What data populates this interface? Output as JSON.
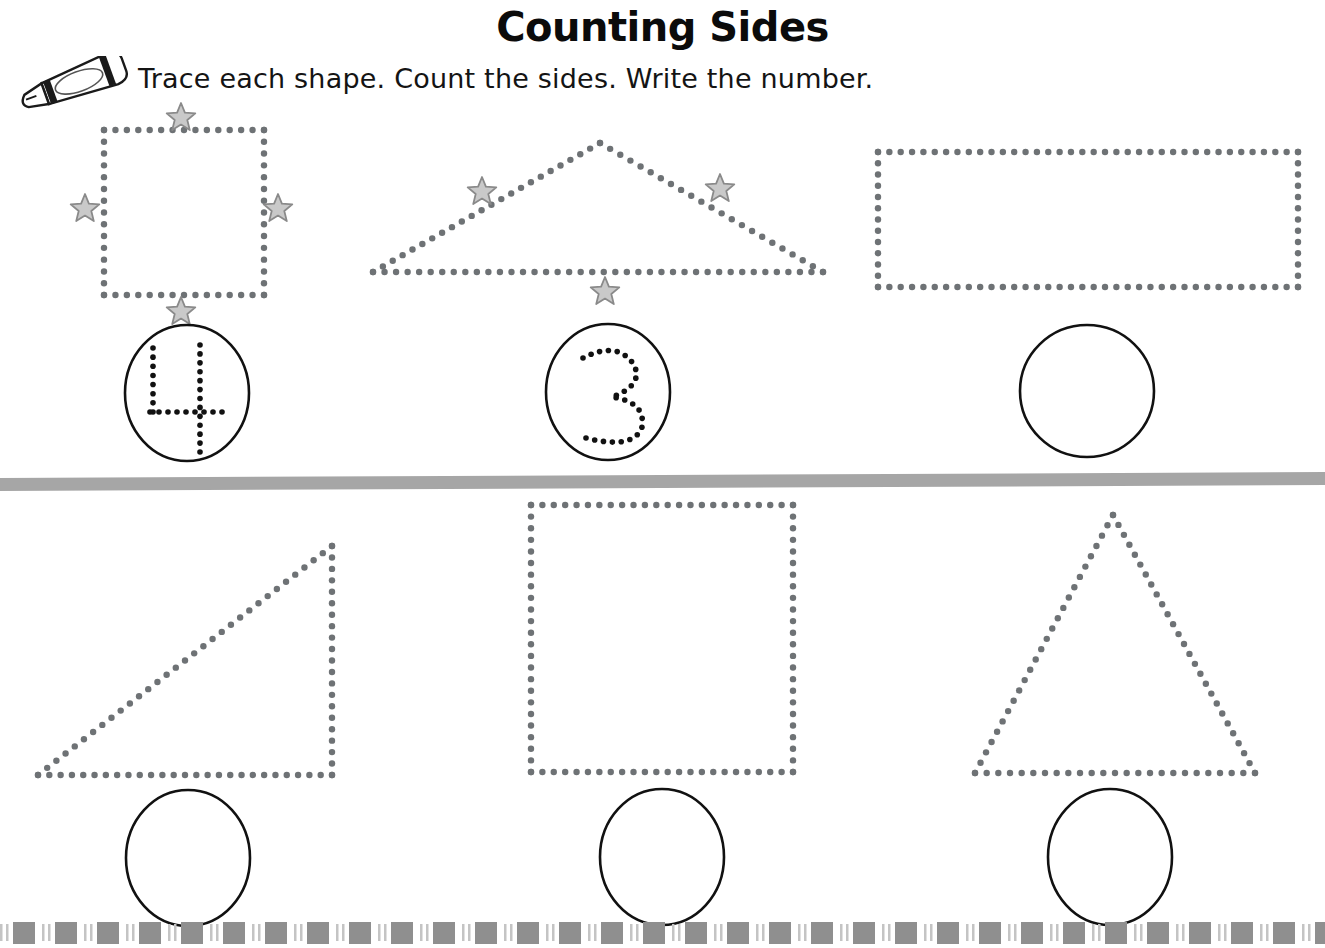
{
  "page": {
    "title": "Counting Sides",
    "instructions": "Trace each shape.  Count the sides.  Write the number.",
    "crayon_icon": "crayon-icon",
    "width": 1325,
    "height": 948
  },
  "colors": {
    "ink": "#141414",
    "title": "#0b0b0b",
    "dot": "#6e7275",
    "star_fill": "#c9c9c9",
    "star_stroke": "#8a8a8a",
    "divider": "#a6a6a6",
    "border_block": "#8f8f8f",
    "border_tick": "#c4c4c4",
    "circle_stroke": "#111111",
    "paper": "#ffffff"
  },
  "divider": {
    "name": "section-divider",
    "label": "horizontal gray divider bar",
    "y": 478,
    "height": 13,
    "tilt_px": 6
  },
  "bottom_border": {
    "name": "decorative-bottom-border",
    "label": "repeating dashed block border",
    "y": 922,
    "height": 22,
    "pattern": "tick tick block",
    "repeat_width": 42,
    "block_count": 32
  },
  "rows": [
    {
      "row_index": 1,
      "name": "row-top",
      "problems": [
        {
          "index": 1,
          "name": "problem-square",
          "shape": "square",
          "shape_label": "dotted square",
          "sides": 4,
          "stars": 4,
          "star_label": "side marker star",
          "answer": "4",
          "answer_traced": true,
          "answer_label": "traced numeral four",
          "circle_cx": 187,
          "circle_cy": 393,
          "circle_rx": 62,
          "circle_ry": 68
        },
        {
          "index": 2,
          "name": "problem-triangle-wide",
          "shape": "triangle",
          "shape_label": "dotted wide triangle",
          "sides": 3,
          "stars": 3,
          "star_label": "side marker star",
          "answer": "3",
          "answer_traced": true,
          "answer_label": "traced numeral three",
          "circle_cx": 608,
          "circle_cy": 392,
          "circle_rx": 62,
          "circle_ry": 68
        },
        {
          "index": 3,
          "name": "problem-rectangle",
          "shape": "rectangle",
          "shape_label": "dotted wide rectangle",
          "sides": 4,
          "stars": 0,
          "star_label": "",
          "answer": "",
          "answer_traced": false,
          "answer_label": "empty answer circle",
          "circle_cx": 1087,
          "circle_cy": 391,
          "circle_rx": 67,
          "circle_ry": 66
        }
      ]
    },
    {
      "row_index": 2,
      "name": "row-bottom",
      "problems": [
        {
          "index": 4,
          "name": "problem-right-triangle",
          "shape": "right-triangle",
          "shape_label": "dotted right triangle",
          "sides": 3,
          "stars": 0,
          "star_label": "",
          "answer": "",
          "answer_traced": false,
          "answer_label": "empty answer circle",
          "circle_cx": 188,
          "circle_cy": 858,
          "circle_rx": 62,
          "circle_ry": 68
        },
        {
          "index": 5,
          "name": "problem-square-large",
          "shape": "square",
          "shape_label": "dotted large square",
          "sides": 4,
          "stars": 0,
          "star_label": "",
          "answer": "",
          "answer_traced": false,
          "answer_label": "empty answer circle",
          "circle_cx": 662,
          "circle_cy": 857,
          "circle_rx": 62,
          "circle_ry": 68
        },
        {
          "index": 6,
          "name": "problem-triangle-tall",
          "shape": "triangle",
          "shape_label": "dotted tall triangle",
          "sides": 3,
          "stars": 0,
          "star_label": "",
          "answer": "",
          "answer_traced": false,
          "answer_label": "empty answer circle",
          "circle_cx": 1110,
          "circle_cy": 857,
          "circle_rx": 62,
          "circle_ry": 68
        }
      ]
    }
  ],
  "geometry": {
    "square_top": {
      "x": 104,
      "y": 130,
      "w": 160,
      "h": 165
    },
    "triangle_wide": {
      "left_x": 373,
      "right_x": 823,
      "base_y": 272,
      "apex_x": 600,
      "apex_y": 143
    },
    "rectangle_top": {
      "x": 878,
      "y": 152,
      "w": 420,
      "h": 135
    },
    "right_triangle": {
      "left_x": 38,
      "base_y": 775,
      "right_x": 332,
      "apex_y": 546
    },
    "square_big": {
      "x": 531,
      "y": 505,
      "w": 262,
      "h": 267
    },
    "triangle_tall": {
      "left_x": 975,
      "right_x": 1255,
      "base_y": 773,
      "apex_x": 1113,
      "apex_y": 515
    }
  },
  "stars_top_square": [
    {
      "name": "star-top",
      "cx": 181,
      "cy": 118
    },
    {
      "name": "star-left",
      "cx": 85,
      "cy": 209
    },
    {
      "name": "star-right",
      "cx": 278,
      "cy": 209
    },
    {
      "name": "star-bottom",
      "cx": 181,
      "cy": 312
    }
  ],
  "stars_top_triangle": [
    {
      "name": "star-left-side",
      "cx": 482,
      "cy": 192
    },
    {
      "name": "star-right-side",
      "cx": 720,
      "cy": 189
    },
    {
      "name": "star-base",
      "cx": 605,
      "cy": 292
    }
  ],
  "traced_numerals": {
    "four": {
      "label": "4",
      "strokes": [
        {
          "name": "diagonal-left",
          "x1": 153,
          "y1": 348,
          "x2": 153,
          "y2": 412
        },
        {
          "name": "horizontal",
          "x1": 150,
          "y1": 412,
          "x2": 222,
          "y2": 412
        },
        {
          "name": "vertical",
          "x1": 200,
          "y1": 345,
          "x2": 200,
          "y2": 452
        }
      ]
    },
    "three": {
      "label": "3",
      "path": "M 583 358 Q 618 340 634 365 Q 644 385 612 397 Q 646 402 642 427 Q 634 450 586 438"
    }
  }
}
